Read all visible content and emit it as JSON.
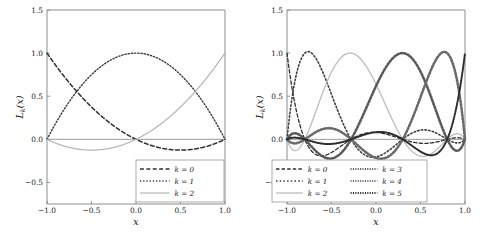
{
  "figure": {
    "background": "#ffffff",
    "panel_count": 2
  },
  "chart_data": [
    {
      "id": "left-panel",
      "type": "line",
      "title": "",
      "xlabel": "x",
      "ylabel": "L_k(x)",
      "xlim": [
        -1.0,
        1.0
      ],
      "ylim": [
        -0.75,
        1.5
      ],
      "grid": false,
      "xticks": [
        -1.0,
        -0.5,
        0.0,
        0.5,
        1.0
      ],
      "xticklabels": [
        "-1.0",
        "-0.5",
        "0.0",
        "0.5",
        "1.0"
      ],
      "yticks": [
        -0.5,
        0.0,
        0.5,
        1.0,
        1.5
      ],
      "yticklabels": [
        "-0.5",
        "0.0",
        "0.5",
        "1.0",
        "1.5"
      ],
      "legend_position": "lower right",
      "nodes": [
        -1.0,
        0.0,
        1.0
      ],
      "series": [
        {
          "name": "k = 0",
          "label": "k = 0",
          "linestyle": "dashed",
          "color": "#2f2f2f",
          "linewidth": 1.5,
          "x": [
            -1.0,
            -0.9,
            -0.8,
            -0.7,
            -0.6,
            -0.5,
            -0.4,
            -0.3,
            -0.2,
            -0.1,
            0.0,
            0.1,
            0.2,
            0.3,
            0.4,
            0.5,
            0.6,
            0.7,
            0.8,
            0.9,
            1.0
          ],
          "values": [
            1.0,
            0.855,
            0.72,
            0.595,
            0.48,
            0.375,
            0.28,
            0.195,
            0.12,
            0.055,
            0.0,
            -0.045,
            -0.08,
            -0.105,
            -0.12,
            -0.125,
            -0.12,
            -0.105,
            -0.08,
            -0.045,
            0.0
          ]
        },
        {
          "name": "k = 1",
          "label": "k = 1",
          "linestyle": "dotted",
          "color": "#3a3a3a",
          "linewidth": 1.4,
          "x": [
            -1.0,
            -0.9,
            -0.8,
            -0.7,
            -0.6,
            -0.5,
            -0.4,
            -0.3,
            -0.2,
            -0.1,
            0.0,
            0.1,
            0.2,
            0.3,
            0.4,
            0.5,
            0.6,
            0.7,
            0.8,
            0.9,
            1.0
          ],
          "values": [
            0.0,
            0.19,
            0.36,
            0.51,
            0.64,
            0.75,
            0.84,
            0.91,
            0.96,
            0.99,
            1.0,
            0.99,
            0.96,
            0.91,
            0.84,
            0.75,
            0.64,
            0.51,
            0.36,
            0.19,
            0.0
          ]
        },
        {
          "name": "k = 2",
          "label": "k = 2",
          "linestyle": "solid",
          "color": "#b4b4b4",
          "linewidth": 1.2,
          "x": [
            -1.0,
            -0.9,
            -0.8,
            -0.7,
            -0.6,
            -0.5,
            -0.4,
            -0.3,
            -0.2,
            -0.1,
            0.0,
            0.1,
            0.2,
            0.3,
            0.4,
            0.5,
            0.6,
            0.7,
            0.8,
            0.9,
            1.0
          ],
          "values": [
            0.0,
            -0.045,
            -0.08,
            -0.105,
            -0.12,
            -0.125,
            -0.12,
            -0.105,
            -0.08,
            -0.045,
            0.0,
            0.055,
            0.12,
            0.195,
            0.28,
            0.375,
            0.48,
            0.595,
            0.72,
            0.855,
            1.0
          ]
        }
      ]
    },
    {
      "id": "right-panel",
      "type": "line",
      "title": "",
      "xlabel": "x",
      "ylabel": "L_k(x)",
      "xlim": [
        -1.0,
        1.0
      ],
      "ylim": [
        -0.75,
        1.5
      ],
      "grid": false,
      "xticks": [
        -1.0,
        -0.5,
        0.0,
        0.5,
        1.0
      ],
      "xticklabels": [
        "-1.0",
        "-0.5",
        "0.0",
        "0.5",
        "1.0"
      ],
      "yticks": [
        -0.5,
        0.0,
        0.5,
        1.0,
        1.5
      ],
      "yticklabels": [
        "-0.5",
        "0.0",
        "0.5",
        "1.0",
        "1.5"
      ],
      "legend_position": "lower left",
      "legend_columns": 2,
      "nodes": [
        -1.0,
        -0.8,
        -0.28,
        0.3,
        0.8,
        1.0
      ],
      "series": [
        {
          "name": "k = 0",
          "label": "k = 0",
          "linestyle": "dashed",
          "color": "#2f2f2f",
          "linewidth": 1.3,
          "peak_x": -1.0,
          "peak_y": 1.0
        },
        {
          "name": "k = 1",
          "label": "k = 1",
          "linestyle": "dotted",
          "color": "#3f3f3f",
          "linewidth": 1.6,
          "peak_x": -0.78,
          "peak_y": 1.0
        },
        {
          "name": "k = 2",
          "label": "k = 2",
          "linestyle": "solid",
          "color": "#bcbcbc",
          "linewidth": 1.3,
          "peak_x": -0.28,
          "peak_y": 1.0
        },
        {
          "name": "k = 3",
          "label": "k = 3",
          "linestyle": "dotted-marker",
          "color": "#5a5a5a",
          "linewidth": 2.6,
          "peak_x": 0.3,
          "peak_y": 1.0
        },
        {
          "name": "k = 4",
          "label": "k = 4",
          "linestyle": "dotted-marker",
          "color": "#6a6a6a",
          "linewidth": 2.6,
          "peak_x": 0.8,
          "peak_y": 1.0
        },
        {
          "name": "k = 5",
          "label": "k = 5",
          "linestyle": "dotted-marker",
          "color": "#2b2b2b",
          "linewidth": 2.0,
          "peak_x": 1.0,
          "peak_y": 1.0
        }
      ]
    }
  ]
}
